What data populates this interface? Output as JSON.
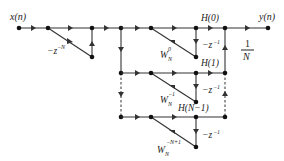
{
  "diagram": {
    "input_label": "x(n)",
    "output_label": "y(n)",
    "comb_gain": {
      "base": "−z",
      "exp": "−N"
    },
    "output_gain": {
      "num": "1",
      "den": "N"
    },
    "branches": [
      {
        "h_label": "H(0)",
        "w_base": "W",
        "w_sub": "N",
        "w_exp": "0",
        "delay": {
          "base": "−z",
          "exp": "−1"
        }
      },
      {
        "h_label": "H(1)",
        "w_base": "W",
        "w_sub": "N",
        "w_exp": "−1",
        "delay": {
          "base": "−z",
          "exp": "−1"
        }
      },
      {
        "h_label": "H(N−1)",
        "w_base": "W",
        "w_sub": "N",
        "w_exp": "−N+1",
        "delay": {
          "base": "−z",
          "exp": "−1"
        }
      }
    ],
    "colors": {
      "line": "#333333",
      "node": "#111111",
      "text": "#222222"
    }
  }
}
